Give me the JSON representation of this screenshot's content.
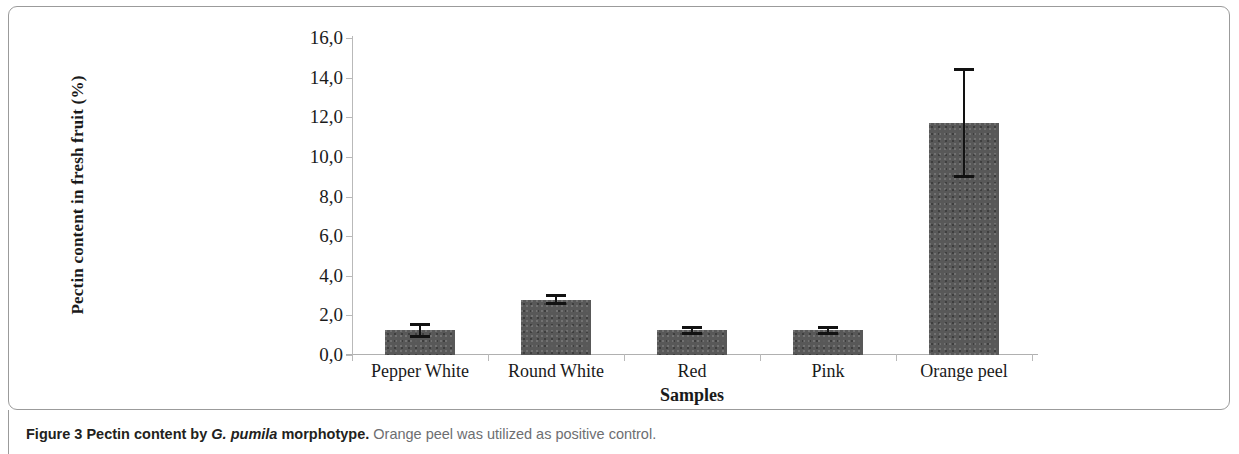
{
  "figure": {
    "caption_label": "Figure 3",
    "caption_title_a": " Pectin content by ",
    "caption_species": "G. pumila",
    "caption_title_b": " morphotype.",
    "caption_rest": " Orange peel was utilized as positive control."
  },
  "chart_data": {
    "type": "bar",
    "title": "",
    "subtitle": "",
    "xlabel": "Samples",
    "ylabel": "Pectin content in fresh fruit (%)",
    "categories": [
      "Pepper White",
      "Round White",
      "Red",
      "Pink",
      "Orange peel"
    ],
    "values": [
      1.25,
      2.8,
      1.25,
      1.25,
      11.7
    ],
    "errors": [
      0.3,
      0.2,
      0.15,
      0.15,
      2.7
    ],
    "error_type": "symmetric",
    "ylim": [
      0,
      16
    ],
    "ytick_values": [
      0,
      2,
      4,
      6,
      8,
      10,
      12,
      14,
      16
    ],
    "ytick_labels": [
      "0,0",
      "2,0",
      "4,0",
      "6,0",
      "8,0",
      "10,0",
      "12,0",
      "14,0",
      "16,0"
    ],
    "decimal_separator": ",",
    "grid": false,
    "legend": "none",
    "bar_color": "#585858",
    "bar_edge_color": "#585858",
    "error_bar_color": "#121212",
    "axis_color": "#b9b9b9",
    "text_color": "#1a1a1a"
  }
}
